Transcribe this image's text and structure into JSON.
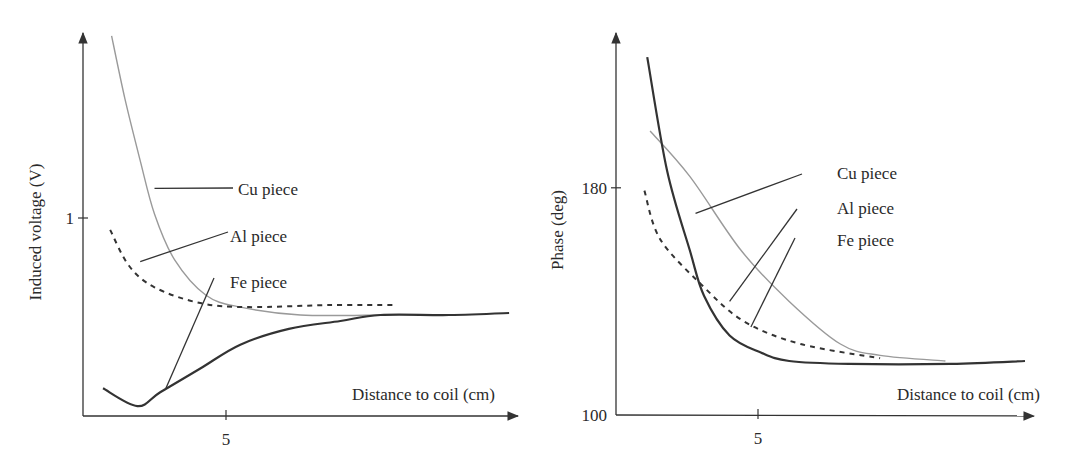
{
  "chart_data": [
    {
      "type": "line",
      "title": "",
      "xlabel": "Distance to coil (cm)",
      "ylabel": "Induced voltage (V)",
      "xlim": [
        0,
        15.5
      ],
      "ylim": [
        0,
        2.0
      ],
      "xticks": [
        5
      ],
      "xtick_labels": [
        "5"
      ],
      "yticks": [
        1
      ],
      "ytick_labels": [
        "1"
      ],
      "grid": false,
      "legend": "annotations with leader lines",
      "series": [
        {
          "name": "Cu piece",
          "style": "solid-light",
          "color": "#9a9a9a",
          "x": [
            1.0,
            1.47,
            2.0,
            2.5,
            3.2,
            4.3,
            5.5,
            7.6,
            10.4
          ],
          "y": [
            1.92,
            1.6,
            1.29,
            1.02,
            0.79,
            0.61,
            0.55,
            0.51,
            0.51
          ]
        },
        {
          "name": "Al piece",
          "style": "dashed",
          "color": "#333333",
          "x": [
            0.95,
            1.6,
            2.5,
            4.1,
            5.8,
            8.6,
            10.9
          ],
          "y": [
            0.94,
            0.76,
            0.65,
            0.57,
            0.55,
            0.56,
            0.56
          ]
        },
        {
          "name": "Fe piece",
          "style": "solid-dark",
          "color": "#333333",
          "x": [
            0.7,
            1.9,
            2.7,
            4.1,
            5.5,
            7.2,
            9.0,
            10.4,
            12.8,
            14.9
          ],
          "y": [
            0.14,
            0.05,
            0.12,
            0.24,
            0.36,
            0.44,
            0.48,
            0.51,
            0.51,
            0.52
          ]
        }
      ],
      "annotations": [
        {
          "text": "Cu piece",
          "points_to": "Cu piece",
          "at": [
            2.5,
            1.15
          ]
        },
        {
          "text": "Al piece",
          "points_to": "Al piece",
          "at": [
            2.0,
            0.78
          ]
        },
        {
          "text": "Fe piece",
          "points_to": "Fe piece",
          "at": [
            2.9,
            0.14
          ]
        }
      ]
    },
    {
      "type": "line",
      "title": "",
      "xlabel": "Distance to coil (cm)",
      "ylabel": "Phase (deg)",
      "xlim": [
        0,
        15.5
      ],
      "ylim": [
        100,
        230
      ],
      "xticks": [
        5
      ],
      "xtick_labels": [
        "5"
      ],
      "yticks": [
        100,
        180
      ],
      "ytick_labels": [
        "100",
        "180"
      ],
      "grid": false,
      "legend": "annotations with leader lines",
      "series": [
        {
          "name": "Cu piece",
          "style": "solid-light",
          "color": "#9a9a9a",
          "x": [
            1.2,
            2.6,
            4.4,
            6.1,
            7.9,
            9.3,
            11.6
          ],
          "y": [
            200,
            184,
            158,
            140,
            125,
            121,
            119
          ]
        },
        {
          "name": "Al piece",
          "style": "dashed",
          "color": "#333333",
          "x": [
            1.0,
            1.55,
            3.0,
            4.5,
            6.5,
            9.3
          ],
          "y": [
            179,
            162,
            146,
            133,
            125,
            120
          ]
        },
        {
          "name": "Fe piece",
          "style": "solid-dark",
          "color": "#333333",
          "x": [
            1.1,
            1.8,
            2.6,
            3.1,
            4.0,
            5.1,
            6.1,
            8.2,
            11.8,
            14.4
          ],
          "y": [
            226,
            186,
            158,
            142,
            128,
            122,
            119,
            118,
            118,
            119
          ]
        }
      ],
      "annotations": [
        {
          "text": "Cu piece",
          "points_to": "Fe piece",
          "at": [
            2.8,
            171
          ]
        },
        {
          "text": "Al piece",
          "points_to": "Al piece",
          "at": [
            4.0,
            140
          ]
        },
        {
          "text": "Fe piece",
          "points_to": "Fe piece",
          "at": [
            4.75,
            131
          ]
        }
      ]
    }
  ]
}
